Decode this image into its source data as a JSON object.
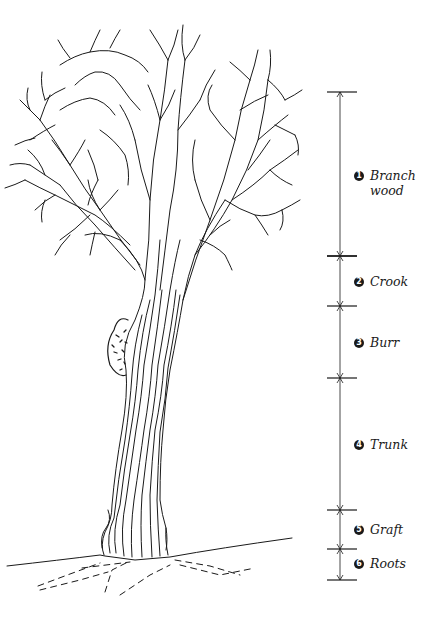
{
  "diagram": {
    "scale": {
      "x": 340,
      "ticks_y": [
        92,
        256,
        306,
        378,
        510,
        549,
        580
      ]
    },
    "sections": [
      {
        "number": "1",
        "label": "Branch\nwood",
        "y_top": 92,
        "y_bottom": 256
      },
      {
        "number": "2",
        "label": "Crook",
        "y_top": 256,
        "y_bottom": 306
      },
      {
        "number": "3",
        "label": "Burr",
        "y_top": 306,
        "y_bottom": 378
      },
      {
        "number": "4",
        "label": "Trunk",
        "y_top": 378,
        "y_bottom": 510
      },
      {
        "number": "5",
        "label": "Graft",
        "y_top": 510,
        "y_bottom": 549
      },
      {
        "number": "6",
        "label": "Roots",
        "y_top": 549,
        "y_bottom": 580
      }
    ],
    "colors": {
      "ink": "#1a1a1a",
      "background": "#ffffff"
    }
  }
}
